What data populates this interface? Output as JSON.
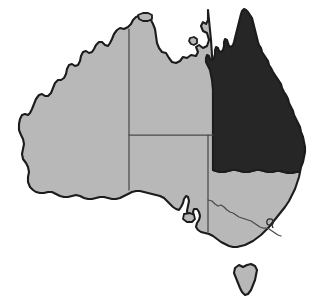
{
  "figure": {
    "kind": "choropleth-map",
    "highlight_state": "Queensland",
    "background_color": "#ffffff"
  },
  "palette": {
    "highlight_fill": "#262626",
    "base_fill": "#b8b8b8",
    "outline_stroke": "#1c1c1c",
    "internal_border_stroke": "#4a4a4a"
  },
  "regions": [
    {
      "id": "western-australia",
      "name": "Western Australia",
      "abbr": "WA",
      "fill": "#b8b8b8",
      "highlighted": false
    },
    {
      "id": "northern-territory",
      "name": "Northern Territory",
      "abbr": "NT",
      "fill": "#b8b8b8",
      "highlighted": false
    },
    {
      "id": "south-australia",
      "name": "South Australia",
      "abbr": "SA",
      "fill": "#b8b8b8",
      "highlighted": false
    },
    {
      "id": "queensland",
      "name": "Queensland",
      "abbr": "QLD",
      "fill": "#262626",
      "highlighted": true
    },
    {
      "id": "new-south-wales",
      "name": "New South Wales",
      "abbr": "NSW",
      "fill": "#b8b8b8",
      "highlighted": false
    },
    {
      "id": "victoria",
      "name": "Victoria",
      "abbr": "VIC",
      "fill": "#b8b8b8",
      "highlighted": false
    },
    {
      "id": "australian-capital-territory",
      "name": "Australian Capital Territory",
      "abbr": "ACT",
      "fill": "none",
      "highlighted": false
    },
    {
      "id": "tasmania",
      "name": "Tasmania",
      "abbr": "TAS",
      "fill": "#b8b8b8",
      "highlighted": false
    },
    {
      "id": "melville-island",
      "name": "Melville Island",
      "abbr": "",
      "fill": "#b8b8b8",
      "highlighted": false
    },
    {
      "id": "groote-eylandt",
      "name": "Groote Eylandt",
      "abbr": "",
      "fill": "#b8b8b8",
      "highlighted": false
    },
    {
      "id": "kangaroo-island",
      "name": "Kangaroo Island",
      "abbr": "",
      "fill": "#b8b8b8",
      "highlighted": false
    }
  ]
}
